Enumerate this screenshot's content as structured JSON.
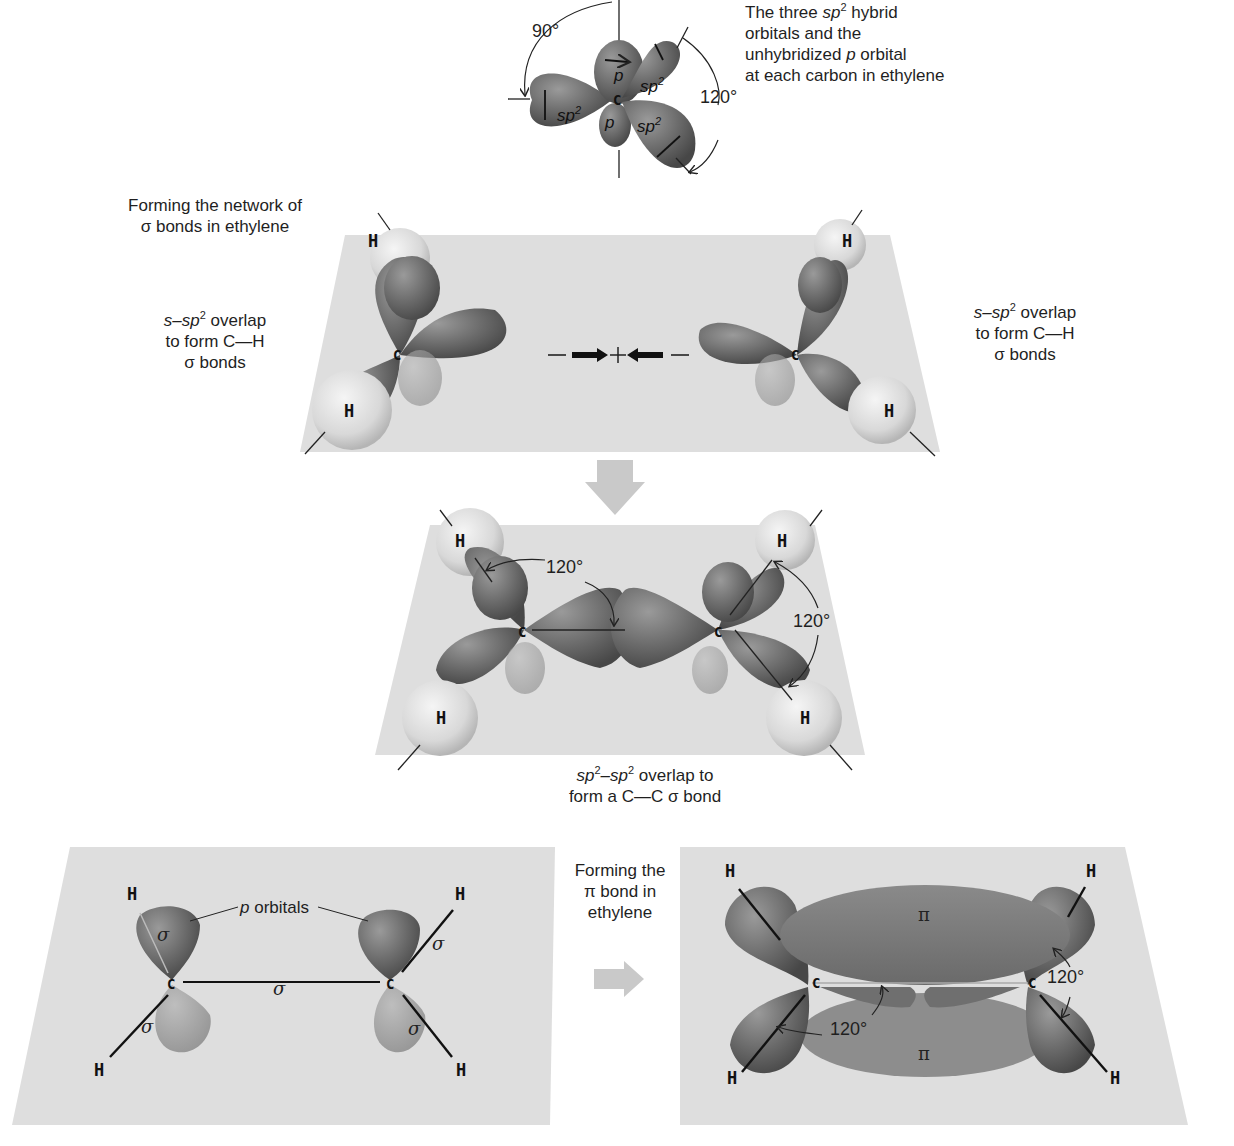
{
  "figure": {
    "panel_top": {
      "caption_line1_pre": "The three ",
      "caption_line1_orbital": "sp",
      "caption_line1_sup": "2",
      "caption_line1_post": " hybrid",
      "caption_line2": "orbitals and the",
      "caption_line3_pre": "unhybridized ",
      "caption_line3_p": "p",
      "caption_line3_post": " orbital",
      "caption_line4": "at each carbon in ethylene",
      "angle_left": "90°",
      "angle_right": "120°",
      "center_atom": "C",
      "lobe_labels": {
        "p_top": "p",
        "p_bottom": "p",
        "sp2_label": "sp",
        "sup": "2"
      }
    },
    "panel_sigma_network": {
      "title_line1": "Forming the network of",
      "title_line2": "σ bonds in ethylene",
      "left_note_line1_pre": "s–sp",
      "left_note_line1_sup": "2",
      "left_note_line1_post": " overlap",
      "left_note_line2": "to form C—H",
      "left_note_line3": "σ bonds",
      "right_note_line1_pre": "s–sp",
      "right_note_line1_sup": "2",
      "right_note_line1_post": " overlap",
      "right_note_line2": "to form C—H",
      "right_note_line3": "σ bonds",
      "approach_symbol": "—➞ + ⟵—",
      "plus": "+",
      "atoms": {
        "c": "C",
        "h": "H"
      }
    },
    "panel_cc_sigma": {
      "angle_top_left": "120°",
      "angle_right": "120°",
      "caption_line1_a": "sp",
      "caption_line1_sup_a": "2",
      "caption_line1_mid": "–sp",
      "caption_line1_sup_b": "2",
      "caption_line1_post": " overlap to",
      "caption_line2": "form a C—C σ bond",
      "atoms": {
        "c": "C",
        "h": "H"
      }
    },
    "panel_p_orbitals": {
      "p_orbitals_label": "p orbitals",
      "p_italic": "p",
      "p_rest": " orbitals",
      "sigma": "σ",
      "atoms": {
        "c": "C",
        "h": "H"
      }
    },
    "transition_label": {
      "line1": "Forming the",
      "line2": "π bond in",
      "line3": "ethylene"
    },
    "panel_pi_bond": {
      "pi_top": "π",
      "pi_bottom": "π",
      "angle_left": "120°",
      "angle_right": "120°",
      "atoms": {
        "c": "C",
        "h": "H"
      }
    }
  },
  "colors": {
    "plane": "#dcdcdc",
    "lobe_dark": "#5e5e5e",
    "lobe_mid": "#7d7d7d",
    "lobe_light": "#a0a0a0",
    "h_sphere": "#e6e6e6",
    "arrow_gray": "#c9c9c9",
    "text": "#1f1f1f"
  }
}
